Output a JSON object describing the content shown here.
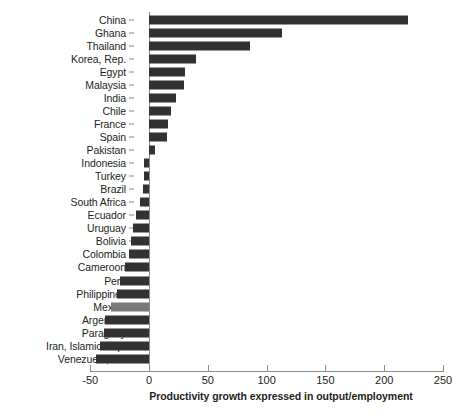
{
  "chart_data": {
    "type": "bar",
    "orientation": "horizontal",
    "title": "",
    "xlabel": "Productivity growth expressed in output/employment",
    "ylabel": "",
    "xlim": [
      -50,
      250
    ],
    "xticks": [
      -50,
      0,
      50,
      100,
      150,
      200,
      250
    ],
    "xtick_labels": [
      "-50",
      "0",
      "50",
      "100",
      "150",
      "200",
      "250"
    ],
    "grid": false,
    "legend": null,
    "bar_color": "#333132",
    "highlight_color": "#7b7a7b",
    "highlight_category": "Mexico",
    "categories": [
      "China",
      "Ghana",
      "Thailand",
      "Korea, Rep.",
      "Egypt",
      "Malaysia",
      "India",
      "Chile",
      "France",
      "Spain",
      "Pakistan",
      "Indonesia",
      "Turkey",
      "Brazil",
      "South Africa",
      "Ecuador",
      "Uruguay",
      "Bolivia",
      "Colombia",
      "Cameroon",
      "Peru",
      "Philippines",
      "Mexico",
      "Argentina",
      "Paraguay",
      "Iran, Islamic Rep.",
      "Venezuela, RB"
    ],
    "values": [
      220,
      113,
      86,
      40,
      31,
      30,
      23,
      19,
      16,
      15,
      5,
      -4,
      -4,
      -5,
      -8,
      -11,
      -14,
      -15,
      -17,
      -20,
      -25,
      -27,
      -32,
      -37,
      -38,
      -42,
      -45
    ]
  }
}
